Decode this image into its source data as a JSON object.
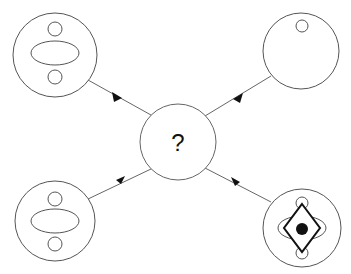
{
  "diagram": {
    "center_node": {
      "label": "?"
    },
    "nodes": [
      {
        "id": "top-left",
        "description": "circle with small top circle, central ellipse, small bottom circle"
      },
      {
        "id": "top-right",
        "description": "circle with small top circle only"
      },
      {
        "id": "bottom-left",
        "description": "circle with small top circle, central ellipse, small bottom circle"
      },
      {
        "id": "bottom-right",
        "description": "circle with top/bottom circles, ellipse, diamond and filled center dot"
      }
    ],
    "edges": [
      {
        "from": "top-left",
        "to": "center"
      },
      {
        "from": "top-right",
        "to": "center"
      },
      {
        "from": "bottom-left",
        "to": "center"
      },
      {
        "from": "bottom-right",
        "to": "center"
      }
    ],
    "colors": {
      "stroke": "#555555",
      "dark_stroke": "#111111",
      "fill": "#ffffff"
    }
  }
}
